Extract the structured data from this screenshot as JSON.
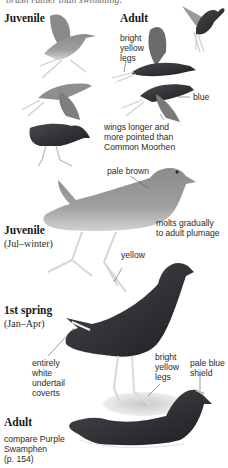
{
  "page": {
    "cut_off_text": "brush rather than swimming."
  },
  "flight_section": {
    "juvenile_heading": "Juvenile",
    "adult_heading": "Adult",
    "annotations": {
      "bright_yellow_legs": [
        "bright",
        "yellow",
        "legs"
      ],
      "blue": "blue",
      "wings": [
        "wings longer and",
        "more pointed than",
        "Common Moorhen"
      ]
    }
  },
  "juvenile_section": {
    "heading": "Juvenile",
    "subheading": "(Jul–winter)",
    "annotations": {
      "pale_brown": "pale brown",
      "molts": [
        "molts gradually",
        "to adult plumage"
      ],
      "yellow": "yellow"
    }
  },
  "first_spring_section": {
    "heading": "1st spring",
    "subheading": "(Jan–Apr)",
    "annotations": {
      "undertail": [
        "entirely",
        "white",
        "undertail",
        "coverts"
      ],
      "legs": [
        "bright",
        "yellow",
        "legs"
      ],
      "shield": [
        "pale blue",
        "shield"
      ]
    }
  },
  "adult_section": {
    "heading": "Adult",
    "note": [
      "compare Purple",
      "Swamphen",
      "(p. 154)"
    ]
  },
  "colors": {
    "dark_bird": "#2b2b2e",
    "mid_bird": "#6e6e6e",
    "pale_bird": "#a9a9a9",
    "legs": "#d8d8d8",
    "leader_line": "#555555"
  }
}
